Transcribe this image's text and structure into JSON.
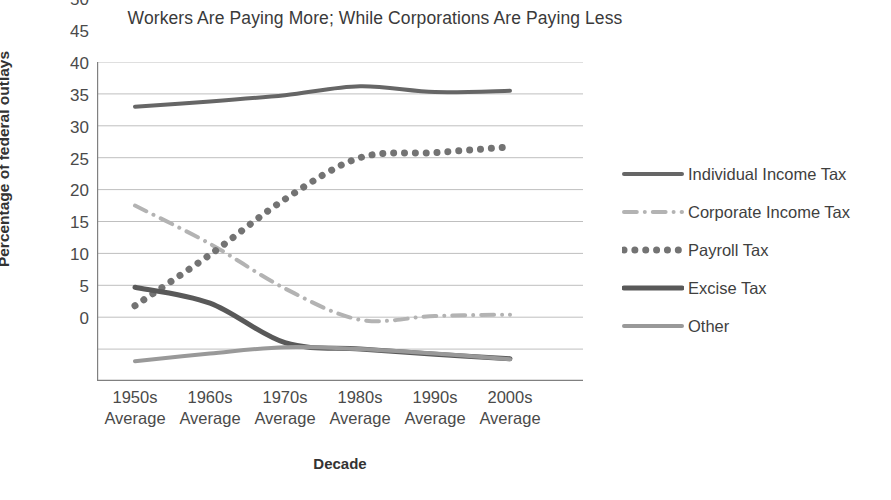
{
  "chart": {
    "title": "Workers Are Paying More; While Corporations Are Paying Less",
    "xlabel": "Decade",
    "ylabel": "Percentage of federal outlays"
  },
  "chart_data": {
    "type": "line",
    "title": "Workers Are Paying More; While Corporations Are Paying Less",
    "xlabel": "Decade",
    "ylabel": "Percentage of federal outlays",
    "categories": [
      "1950s Average",
      "1960s Average",
      "1970s Average",
      "1980s Average",
      "1990s Average",
      "2000s Average"
    ],
    "category_lines": [
      [
        "1950s",
        "Average"
      ],
      [
        "1960s",
        "Average"
      ],
      [
        "1970s",
        "Average"
      ],
      [
        "1980s",
        "Average"
      ],
      [
        "1990s",
        "Average"
      ],
      [
        "2000s",
        "Average"
      ]
    ],
    "ylim": [
      0,
      50
    ],
    "yticks": [
      50,
      45,
      40,
      35,
      30,
      25,
      20,
      15,
      10,
      5,
      0
    ],
    "grid": true,
    "legend_position": "right",
    "series": [
      {
        "name": "Individual Income Tax",
        "values": [
          43.0,
          43.8,
          44.8,
          46.2,
          45.3,
          45.5
        ],
        "color": "#666666",
        "style": "solid",
        "width": 4
      },
      {
        "name": "Corporate Income Tax",
        "values": [
          27.5,
          21.5,
          14.5,
          9.6,
          10.2,
          10.4
        ],
        "color": "#b3b3b3",
        "style": "dash-dot",
        "width": 4
      },
      {
        "name": "Payroll Tax",
        "values": [
          11.8,
          19.8,
          28.5,
          35.0,
          35.8,
          36.7
        ],
        "color": "#737373",
        "style": "dotted",
        "width": 7
      },
      {
        "name": "Excise Tax",
        "values": [
          14.7,
          12.2,
          6.0,
          5.0,
          4.2,
          3.5
        ],
        "color": "#595959",
        "style": "solid",
        "width": 5
      },
      {
        "name": "Other",
        "values": [
          3.1,
          4.3,
          5.3,
          5.0,
          4.3,
          3.4
        ],
        "color": "#999999",
        "style": "solid",
        "width": 4
      }
    ],
    "colors": {
      "gridline": "#bfbfbf",
      "axis": "#808080",
      "text": "#404040"
    }
  },
  "legend": {
    "items": [
      {
        "label": "Individual Income Tax"
      },
      {
        "label": "Corporate Income Tax"
      },
      {
        "label": "Payroll Tax"
      },
      {
        "label": "Excise Tax"
      },
      {
        "label": "Other"
      }
    ]
  }
}
